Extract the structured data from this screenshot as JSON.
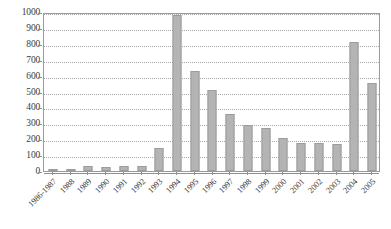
{
  "chart_data": {
    "type": "bar",
    "title": "",
    "subtitle": "",
    "xlabel": "",
    "ylabel": "",
    "ylim": [
      0,
      1000
    ],
    "yticks": [
      0,
      100,
      200,
      300,
      400,
      500,
      600,
      700,
      800,
      900,
      1000
    ],
    "ytick_labels": [
      "0",
      "100",
      "200",
      "300",
      "400",
      "500",
      "600",
      "700",
      "800",
      "900",
      "1000"
    ],
    "grid": "horizontal-dotted",
    "legend": "none",
    "bar_color": "#b4b4b4",
    "bar_edge_color": "#9c9c9c",
    "axis_color": "#8f8f8f",
    "grid_color": "#a8a8a8",
    "categories": [
      "1986-1987",
      "1988",
      "1989",
      "1990",
      "1991",
      "1992",
      "1993",
      "1994",
      "1995",
      "1996",
      "1997",
      "1998",
      "1999",
      "2000",
      "2001",
      "2002",
      "2003",
      "2004",
      "2005"
    ],
    "values": [
      5,
      12,
      32,
      28,
      33,
      30,
      145,
      980,
      630,
      510,
      360,
      292,
      272,
      205,
      178,
      175,
      172,
      810,
      555
    ]
  }
}
